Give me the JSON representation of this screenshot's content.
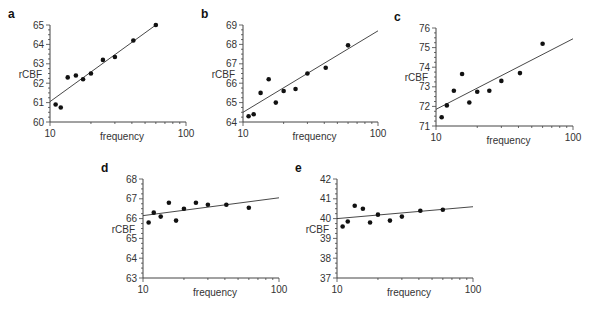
{
  "chart_data": [
    {
      "panel": "a",
      "type": "scatter",
      "xlabel": "frequency",
      "ylabel": "rCBF",
      "xscale": "log",
      "xlim": [
        10,
        100
      ],
      "xticks": [
        "10",
        "100"
      ],
      "ylim": [
        60,
        65
      ],
      "yticks": [
        "60",
        "61",
        "62",
        "63",
        "64",
        "65"
      ],
      "x": [
        11,
        12,
        13.5,
        15.5,
        17.5,
        20,
        24.5,
        30,
        41,
        60
      ],
      "y": [
        60.9,
        60.75,
        62.3,
        62.4,
        62.2,
        62.5,
        63.2,
        63.35,
        64.2,
        65.0
      ],
      "fit": {
        "x": [
          10,
          60
        ],
        "y": [
          61.05,
          65.0
        ]
      }
    },
    {
      "panel": "b",
      "type": "scatter",
      "xlabel": "frequency",
      "ylabel": "rCBF",
      "xscale": "log",
      "xlim": [
        10,
        100
      ],
      "xticks": [
        "10",
        "100"
      ],
      "ylim": [
        64,
        69
      ],
      "yticks": [
        "64",
        "65",
        "66",
        "67",
        "68",
        "69"
      ],
      "x": [
        11,
        12,
        13.5,
        15.5,
        17.5,
        20,
        24.5,
        30,
        41,
        60
      ],
      "y": [
        64.3,
        64.4,
        65.5,
        66.2,
        65.0,
        65.6,
        65.7,
        66.5,
        66.8,
        67.95
      ],
      "fit": {
        "x": [
          10,
          100
        ],
        "y": [
          64.5,
          68.7
        ]
      }
    },
    {
      "panel": "c",
      "type": "scatter",
      "xlabel": "frequency",
      "ylabel": "rCBF",
      "xscale": "log",
      "xlim": [
        10,
        100
      ],
      "xticks": [
        "10",
        "100"
      ],
      "ylim": [
        71,
        76
      ],
      "yticks": [
        "71",
        "72",
        "73",
        "74",
        "75",
        "76"
      ],
      "x": [
        11,
        12,
        13.5,
        15.5,
        17.5,
        20,
        24.5,
        30,
        41,
        60
      ],
      "y": [
        71.45,
        72.05,
        72.8,
        73.65,
        72.2,
        72.75,
        72.8,
        73.3,
        73.7,
        75.2
      ],
      "fit": {
        "x": [
          10,
          100
        ],
        "y": [
          71.85,
          75.45
        ]
      }
    },
    {
      "panel": "d",
      "type": "scatter",
      "xlabel": "frequency",
      "ylabel": "rCBF",
      "xscale": "log",
      "xlim": [
        10,
        100
      ],
      "xticks": [
        "10",
        "100"
      ],
      "ylim": [
        63,
        68
      ],
      "yticks": [
        "63",
        "64",
        "65",
        "66",
        "67",
        "68"
      ],
      "x": [
        11,
        12,
        13.5,
        15.5,
        17.5,
        20,
        24.5,
        30,
        41,
        60
      ],
      "y": [
        65.8,
        66.3,
        66.1,
        66.8,
        65.9,
        66.5,
        66.8,
        66.7,
        66.7,
        66.55
      ],
      "fit": {
        "x": [
          10,
          100
        ],
        "y": [
          66.15,
          67.05
        ]
      }
    },
    {
      "panel": "e",
      "type": "scatter",
      "xlabel": "frequency",
      "ylabel": "rCBF",
      "xscale": "log",
      "xlim": [
        10,
        100
      ],
      "xticks": [
        "10",
        "100"
      ],
      "ylim": [
        37,
        42
      ],
      "yticks": [
        "37",
        "38",
        "39",
        "40",
        "41",
        "42"
      ],
      "x": [
        11,
        12,
        13.5,
        15.5,
        17.5,
        20,
        24.5,
        30,
        41,
        60
      ],
      "y": [
        39.6,
        39.85,
        40.65,
        40.5,
        39.8,
        40.2,
        39.9,
        40.1,
        40.4,
        40.45
      ],
      "fit": {
        "x": [
          10,
          100
        ],
        "y": [
          40.0,
          40.6
        ]
      }
    }
  ],
  "layout": [
    {
      "x0": 50,
      "x1": 186,
      "yTop": 25,
      "yBot": 122
    },
    {
      "x0": 243,
      "x1": 378,
      "yTop": 25,
      "yBot": 122
    },
    {
      "x0": 436,
      "x1": 573,
      "yTop": 28,
      "yBot": 126
    },
    {
      "x0": 143,
      "x1": 279,
      "yTop": 179,
      "yBot": 278
    },
    {
      "x0": 337,
      "x1": 473,
      "yTop": 179,
      "yBot": 278
    }
  ],
  "style": {
    "point_color": "#111111",
    "line_color": "#333333",
    "axis_color": "#444444"
  }
}
